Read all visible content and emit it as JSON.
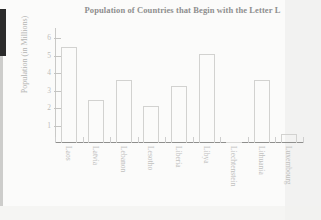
{
  "chart_data": {
    "type": "bar",
    "title": "Population of Countries that Begin with the Letter L",
    "xlabel": "",
    "ylabel": "Population (in Millions)",
    "categories": [
      "Laos",
      "Latvia",
      "Lebanon",
      "Lesotho",
      "Liberia",
      "Libya",
      "Liechtenstein",
      "Lithuania",
      "Luxembourg"
    ],
    "values": [
      5.5,
      2.45,
      3.6,
      2.15,
      3.25,
      5.1,
      0.04,
      3.6,
      0.5
    ],
    "ylim": [
      0,
      6.6
    ],
    "yticks": [
      1,
      2,
      3,
      4,
      5,
      6
    ],
    "ytick_labels": [
      "1",
      "2",
      "3",
      "4",
      "5",
      "6"
    ],
    "grid": false,
    "legend": null,
    "bar_style": "outlined-unfilled",
    "xtick_label_rotation": 90
  },
  "colors": {
    "background": "#fbfbfa",
    "title_text": "#8e8e8e",
    "axis_line": "#8f8f8d",
    "tick_text": "#bdbdbb",
    "bar_outline": "#d2d2d0",
    "label_text": "#c0c0be"
  }
}
